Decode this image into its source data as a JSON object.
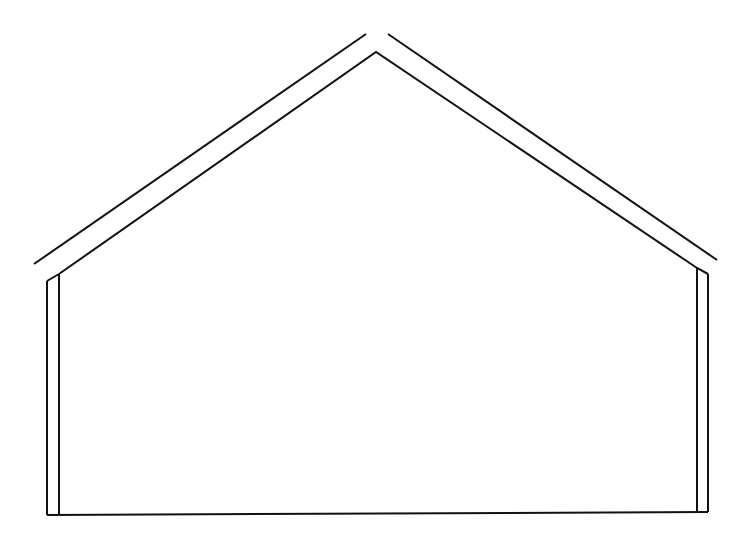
{
  "figure": {
    "type": "line-drawing",
    "stroke_color": "#111111",
    "background": "#ffffff",
    "stroke_width": 2
  },
  "shapes": {
    "outer_roof_left": {
      "x1": 34,
      "y1": 264,
      "x2": 366,
      "y2": 34
    },
    "outer_roof_right": {
      "x1": 388,
      "y1": 34,
      "x2": 717,
      "y2": 260
    },
    "inner_roof": "47,281 59,274 376,52 697,268 708,274",
    "left_wall_outer": {
      "x1": 47,
      "y1": 281,
      "x2": 47,
      "y2": 515
    },
    "left_wall_inner": {
      "x1": 59,
      "y1": 274,
      "x2": 59,
      "y2": 515
    },
    "right_wall_inner": {
      "x1": 697,
      "y1": 268,
      "x2": 697,
      "y2": 512
    },
    "right_wall_outer": {
      "x1": 708,
      "y1": 274,
      "x2": 708,
      "y2": 512
    },
    "floor": {
      "x1": 47,
      "y1": 515,
      "x2": 708,
      "y2": 512
    }
  }
}
